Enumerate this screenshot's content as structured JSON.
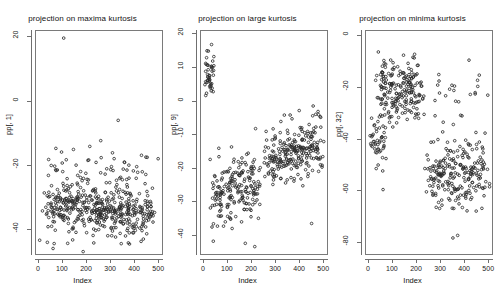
{
  "figure": {
    "background": "#ffffff",
    "point_color": "#2b2b2b",
    "axis_color": "#6f6f6f"
  },
  "panels": [
    {
      "title": "projection on maxima kurtosis",
      "ylabel": "pp[, 1]",
      "xlabel": "Index",
      "yticks": [
        "20",
        "0",
        "-20",
        "-40"
      ],
      "xticks": [
        "0",
        "100",
        "200",
        "300",
        "400",
        "500"
      ]
    },
    {
      "title": "projection on large kurtosis",
      "ylabel": "pp[, 9]",
      "xlabel": "Index",
      "yticks": [
        "20",
        "10",
        "0",
        "-10",
        "-20",
        "-30",
        "-40"
      ],
      "xticks": [
        "0",
        "100",
        "200",
        "300",
        "400",
        "500"
      ]
    },
    {
      "title": "projection on minima kurtosis",
      "ylabel": "pp[, 32]",
      "xlabel": "Index",
      "yticks": [
        "0",
        "-20",
        "-40",
        "-60",
        "-80"
      ],
      "xticks": [
        "0",
        "100",
        "200",
        "300",
        "400",
        "500"
      ]
    }
  ],
  "chart_data": [
    {
      "type": "scatter",
      "title": "projection on maxima kurtosis",
      "xlabel": "Index",
      "ylabel": "pp[, 1]",
      "xlim": [
        -12,
        520
      ],
      "ylim": [
        -48,
        22
      ],
      "yticks": [
        20,
        0,
        -20,
        -40
      ],
      "xticks": [
        0,
        100,
        200,
        300,
        400,
        500
      ],
      "grid": false,
      "legend": false,
      "n_points": 512,
      "description": "Dense horizontal band of points centred near -34 spanning the full index range, a scattering of points between -10 and -25, and one high outlier near index 105 at y = 20.",
      "clusters": [
        {
          "name": "main-band",
          "n": 430,
          "x_range": [
            2,
            512
          ],
          "y_mean": -34,
          "y_sd": 3.6
        },
        {
          "name": "upper-scatter",
          "n": 70,
          "x_range": [
            5,
            505
          ],
          "y_mean": -23,
          "y_sd": 4.5
        },
        {
          "name": "low-tail",
          "n": 11,
          "x_range": [
            55,
            440
          ],
          "y_mean": -44,
          "y_sd": 1.6
        }
      ],
      "outliers": [
        {
          "x": 105,
          "y": 20
        },
        {
          "x": 335,
          "y": -6
        },
        {
          "x": 60,
          "y": -46.5
        }
      ]
    },
    {
      "type": "scatter",
      "title": "projection on large kurtosis",
      "xlabel": "Index",
      "ylabel": "pp[, 9]",
      "xlim": [
        -12,
        520
      ],
      "ylim": [
        -46,
        21
      ],
      "yticks": [
        20,
        10,
        0,
        -10,
        -20,
        -30,
        -40
      ],
      "xticks": [
        0,
        100,
        200,
        300,
        400,
        500
      ],
      "grid": false,
      "legend": false,
      "n_points": 512,
      "description": "A tight compact cluster at low index (0-45) with values between 3 and 20, then a broad diffuse band that rises from about -28 at index 100 to about -14 at index 500.",
      "clusters": [
        {
          "name": "top-left-cluster",
          "n": 45,
          "x_range": [
            2,
            45
          ],
          "y_mean": 9,
          "y_sd": 4.2
        },
        {
          "name": "left-band",
          "n": 200,
          "x_range": [
            20,
            250
          ],
          "y_mean": -26,
          "y_sd": 5.5
        },
        {
          "name": "right-band",
          "n": 250,
          "x_range": [
            250,
            512
          ],
          "y_mean": -15,
          "y_sd": 4.5
        }
      ],
      "outliers": [
        {
          "x": 175,
          "y": -43
        },
        {
          "x": 215,
          "y": -44
        },
        {
          "x": 455,
          "y": -37
        }
      ]
    },
    {
      "type": "scatter",
      "title": "projection on minima kurtosis",
      "xlabel": "Index",
      "ylabel": "pp[, 32]",
      "xlim": [
        -12,
        520
      ],
      "ylim": [
        -85,
        2
      ],
      "yticks": [
        0,
        -20,
        -40,
        -60,
        -80
      ],
      "xticks": [
        0,
        100,
        200,
        300,
        400,
        500
      ],
      "grid": false,
      "legend": false,
      "n_points": 512,
      "description": "Two well-separated clusters: an upper-left cluster spanning indices 30-230 with values around -20, and a lower-right cluster spanning indices 230-510 with values around -55; a sparse group of low points near index 0-40 around -42 and a few stray points at upper right.",
      "clusters": [
        {
          "name": "upper-left-cluster",
          "n": 210,
          "x_range": [
            25,
            235
          ],
          "y_mean": -21,
          "y_sd": 6.0
        },
        {
          "name": "lower-right-cluster",
          "n": 230,
          "x_range": [
            230,
            512
          ],
          "y_mean": -55,
          "y_sd": 7.0
        },
        {
          "name": "left-low-group",
          "n": 45,
          "x_range": [
            2,
            75
          ],
          "y_mean": -42,
          "y_sd": 5.0
        },
        {
          "name": "upper-right-stray",
          "n": 25,
          "x_range": [
            250,
            505
          ],
          "y_mean": -22,
          "y_sd": 6.0
        }
      ],
      "outliers": [
        {
          "x": 355,
          "y": -79
        },
        {
          "x": 375,
          "y": -78
        },
        {
          "x": 60,
          "y": -60
        }
      ]
    }
  ]
}
